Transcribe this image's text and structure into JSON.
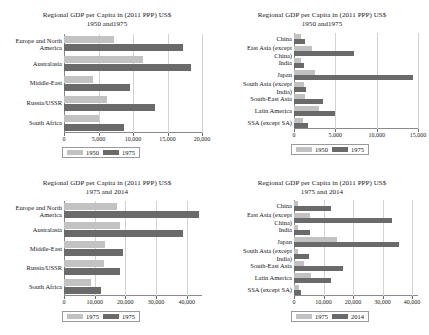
{
  "chart_data": [
    {
      "id": "top-left",
      "type": "bar",
      "orientation": "horizontal",
      "title": "Regional GDP per Capita in (2011 PPP) US$",
      "subtitle": "1950 and1975",
      "xlabel": "",
      "ylabel": "",
      "xlim": [
        0,
        20000
      ],
      "xticks": [
        0,
        5000,
        10000,
        15000,
        20000
      ],
      "xticklabels": [
        "0",
        "5,000",
        "10,000",
        "15,000",
        "20,000"
      ],
      "grid": true,
      "legend_position": "below",
      "categories": [
        "Europe and North America",
        "Australasia",
        "Middle-East",
        "Russia/USSR",
        "South Africa"
      ],
      "series": [
        {
          "name": "1950",
          "values": [
            7300,
            11400,
            4200,
            6200,
            5100
          ]
        },
        {
          "name": "1975",
          "values": [
            17300,
            18400,
            9500,
            13200,
            8700
          ]
        }
      ]
    },
    {
      "id": "top-right",
      "type": "bar",
      "orientation": "horizontal",
      "title": "Regional GDP per Capita in (2011 PPP) US$",
      "subtitle": "1950 and1975",
      "xlabel": "",
      "ylabel": "",
      "xlim": [
        0,
        15000
      ],
      "xticks": [
        0,
        5000,
        10000,
        15000
      ],
      "xticklabels": [
        "0",
        "5,000",
        "10,000",
        "15,000"
      ],
      "grid": true,
      "legend_position": "below",
      "categories": [
        "China",
        "East Asia (except China)",
        "India",
        "Japan",
        "South Asia (except India)",
        "South-East Asia",
        "Latin America",
        "SSA (except SA)"
      ],
      "series": [
        {
          "name": "1950",
          "values": [
            800,
            2200,
            900,
            2600,
            1200,
            1300,
            3000,
            1100
          ]
        },
        {
          "name": "1975",
          "values": [
            1300,
            7200,
            1200,
            14400,
            1500,
            3500,
            4900,
            1700
          ]
        }
      ]
    },
    {
      "id": "bottom-left",
      "type": "bar",
      "orientation": "horizontal",
      "title": "Regional GDP per Capita in (2011 PPP) US$",
      "subtitle": "1975 and 2014",
      "xlabel": "",
      "ylabel": "",
      "xlim": [
        0,
        45000
      ],
      "xticks": [
        0,
        10000,
        20000,
        30000,
        40000
      ],
      "xticklabels": [
        "0",
        "10,000",
        "20,000",
        "30,000",
        "40,000"
      ],
      "grid": true,
      "legend_position": "below",
      "categories": [
        "Europe and North America",
        "Australasia",
        "Middle-East",
        "Russia/USSR",
        "South Africa"
      ],
      "series": [
        {
          "name": "1975",
          "values": [
            17300,
            18400,
            13400,
            13200,
            8700
          ]
        },
        {
          "name": "1975",
          "values": [
            43900,
            38800,
            19400,
            18300,
            12000
          ]
        }
      ]
    },
    {
      "id": "bottom-right",
      "type": "bar",
      "orientation": "horizontal",
      "title": "Regional GDP per Capita in (2011 PPP) US$",
      "subtitle": "1975 and 2014",
      "xlabel": "",
      "ylabel": "",
      "xlim": [
        0,
        42000
      ],
      "xticks": [
        0,
        10000,
        20000,
        30000,
        40000
      ],
      "xticklabels": [
        "0",
        "10,000",
        "20,000",
        "30,000",
        "40,000"
      ],
      "grid": true,
      "legend_position": "below",
      "categories": [
        "China",
        "East Asia (except China)",
        "India",
        "Japan",
        "South Asia (except India)",
        "South-East Asia",
        "Latin America",
        "SSA (except SA)"
      ],
      "series": [
        {
          "name": "1975",
          "values": [
            1300,
            5500,
            1200,
            14400,
            1500,
            3500,
            5600,
            1700
          ]
        },
        {
          "name": "2014",
          "values": [
            12600,
            33200,
            5400,
            35600,
            5200,
            16600,
            12700,
            2400
          ]
        }
      ]
    }
  ],
  "colors": {
    "series1": "#c2c2c2",
    "series2": "#6a6a6a",
    "axis": "#8a8a8a",
    "grid": "#d3d3d3",
    "text": "#16161a",
    "background": "#ffffff"
  }
}
